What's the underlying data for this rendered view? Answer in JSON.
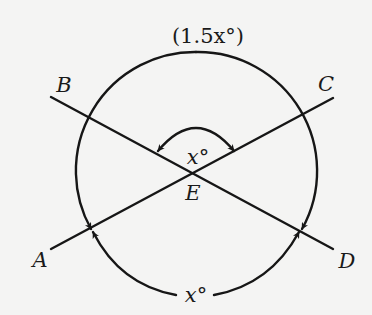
{
  "figure": {
    "type": "geometry-diagram",
    "points": {
      "A": {
        "label": "A"
      },
      "B": {
        "label": "B"
      },
      "C": {
        "label": "C"
      },
      "D": {
        "label": "D"
      },
      "E": {
        "label": "E"
      }
    },
    "angle_labels": {
      "top_arc": "(1.5x°)",
      "inner_angle": "x°",
      "bottom_arc": "x°"
    },
    "segments": [
      {
        "name": "BD",
        "from": "B",
        "to": "D",
        "through": "E"
      },
      {
        "name": "AC",
        "from": "A",
        "to": "C",
        "through": "E"
      }
    ],
    "colors": {
      "background": "#f4f4f3",
      "ink": "#161616"
    }
  }
}
